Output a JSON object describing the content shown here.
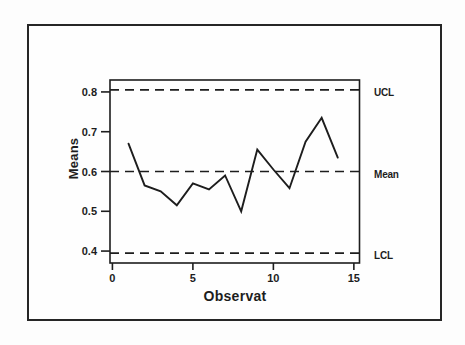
{
  "chart_data": {
    "type": "line",
    "title": "",
    "xlabel": "Observat",
    "ylabel": "Means",
    "x": [
      1,
      2,
      3,
      4,
      5,
      6,
      7,
      8,
      9,
      10,
      11,
      12,
      13,
      14
    ],
    "values": [
      0.67,
      0.565,
      0.55,
      0.515,
      0.57,
      0.555,
      0.59,
      0.5,
      0.655,
      0.605,
      0.558,
      0.675,
      0.735,
      0.635
    ],
    "xlim": [
      -0.15,
      15.35
    ],
    "ylim": [
      0.37,
      0.83
    ],
    "xticks": [
      0,
      5,
      10,
      15
    ],
    "yticks": [
      0.4,
      0.5,
      0.6,
      0.7,
      0.8
    ],
    "grid": false,
    "legend": "none",
    "line_color": "#1d1d1d",
    "reference_lines": [
      {
        "label": "UCL",
        "value": 0.805,
        "style": "dashed"
      },
      {
        "label": "Mean",
        "value": 0.6,
        "style": "dashed"
      },
      {
        "label": "LCL",
        "value": 0.395,
        "style": "dashed"
      }
    ]
  }
}
